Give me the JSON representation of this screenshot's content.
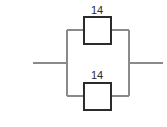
{
  "diagram": {
    "type": "parallel-circuit",
    "canvas": {
      "width": 167,
      "height": 127,
      "background": "#ffffff"
    },
    "colors": {
      "wire": "#8a8a8a",
      "component_border": "#2b2b2b",
      "component_fill": "#ffffff",
      "label_text": "#2b2b2b"
    },
    "branches": [
      {
        "id": "top-branch",
        "component": {
          "name": "top-component",
          "label": "14",
          "x": 84,
          "y": 17,
          "width": 27,
          "height": 27,
          "label_x": 97,
          "label_y": 14
        },
        "rail_y": 30
      },
      {
        "id": "bottom-branch",
        "component": {
          "name": "bottom-component",
          "label": "14",
          "x": 84,
          "y": 83,
          "width": 27,
          "height": 27,
          "label_x": 97,
          "label_y": 79
        },
        "rail_y": 96
      }
    ],
    "rails": {
      "left_x": 67,
      "right_x": 129,
      "top_y": 30,
      "bottom_y": 96
    },
    "leads": {
      "mid_y": 63,
      "left_start_x": 33,
      "left_end_x": 67,
      "right_start_x": 129,
      "right_end_x": 163
    }
  }
}
